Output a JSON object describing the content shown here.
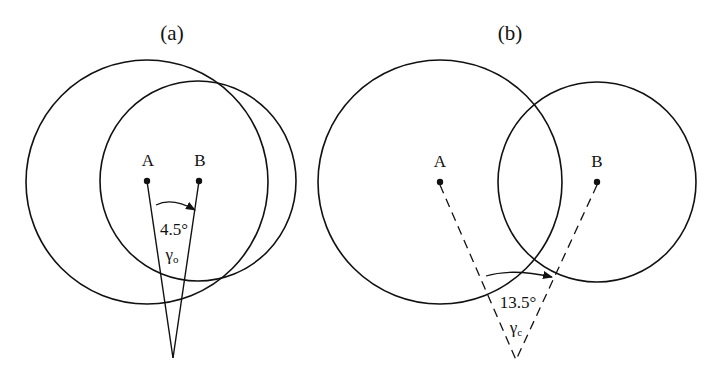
{
  "diagram": {
    "stroke_color": "#111111",
    "background": "#ffffff",
    "panels": [
      {
        "id": "a",
        "title": "(a)",
        "point_a": {
          "label": "A",
          "x": 147,
          "y": 181
        },
        "point_b": {
          "label": "B",
          "x": 199,
          "y": 181
        },
        "circle_a": {
          "cx": 147,
          "cy": 182,
          "rx": 121,
          "ry": 122
        },
        "circle_b": {
          "cx": 198,
          "cy": 181,
          "rx": 98,
          "ry": 100
        },
        "apex": {
          "x": 173,
          "y": 358
        },
        "line_style": "solid",
        "angle_label": "4.5°",
        "gamma_symbol": "γ",
        "gamma_subscript": "o"
      },
      {
        "id": "b",
        "title": "(b)",
        "point_a": {
          "label": "A",
          "x": 440,
          "y": 182
        },
        "point_b": {
          "label": "B",
          "x": 597,
          "y": 182
        },
        "circle_a": {
          "cx": 440,
          "cy": 182,
          "rx": 122,
          "ry": 122
        },
        "circle_b": {
          "cx": 597,
          "cy": 182,
          "rx": 99,
          "ry": 100
        },
        "apex": {
          "x": 516,
          "y": 360
        },
        "line_style": "dashed",
        "angle_label": "13.5°",
        "gamma_symbol": "γ",
        "gamma_subscript": "c"
      }
    ]
  }
}
